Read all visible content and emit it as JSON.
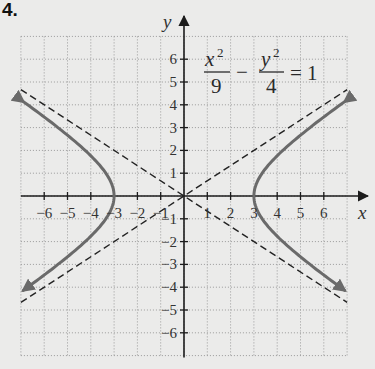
{
  "problem_number": "4.",
  "equation": {
    "term1_num": "x",
    "term1_exp": "2",
    "term1_den": "9",
    "operator": "−",
    "term2_num": "y",
    "term2_exp": "2",
    "term2_den": "4",
    "rhs": "= 1"
  },
  "colors": {
    "background": "#ebebea",
    "axis": "#1c1c1c",
    "grid": "#9a9a9a",
    "curve": "#6a6a6a",
    "asymptote": "#222222",
    "text": "#333333"
  },
  "chart_data": {
    "type": "line",
    "xlabel": "x",
    "ylabel": "y",
    "xlim": [
      -7,
      7
    ],
    "ylim": [
      -7,
      7
    ],
    "grid": true,
    "grid_style": "dotted",
    "legend": null,
    "x_ticks": [
      -6,
      -5,
      -4,
      -3,
      -2,
      -1,
      1,
      2,
      3,
      4,
      5,
      6
    ],
    "x_tick_labels": [
      "−6",
      "−5",
      "−4",
      "−3",
      "−2",
      "−1",
      "1",
      "2",
      "3",
      "4",
      "5",
      "6"
    ],
    "y_ticks": [
      6,
      5,
      4,
      3,
      2,
      1,
      -1,
      -2,
      -3,
      -4,
      -5,
      -6
    ],
    "y_tick_labels": [
      "6",
      "5",
      "4",
      "3",
      "2",
      "1",
      "−1",
      "−2",
      "−3",
      "−4",
      "−5",
      "−6"
    ],
    "series": [
      {
        "name": "hyperbola right branch",
        "style": "solid",
        "equation": "x^2/9 - y^2/4 = 1",
        "x_range": [
          3,
          6.9
        ],
        "vertex": [
          3,
          0
        ],
        "endpoints": [
          [
            6.9,
            4.14
          ],
          [
            6.9,
            -4.14
          ]
        ],
        "arrows": true
      },
      {
        "name": "hyperbola left branch",
        "style": "solid",
        "equation": "x^2/9 - y^2/4 = 1",
        "x_range": [
          -6.9,
          -3
        ],
        "vertex": [
          -3,
          0
        ],
        "endpoints": [
          [
            -6.9,
            4.14
          ],
          [
            -6.9,
            -4.14
          ]
        ],
        "arrows": true
      },
      {
        "name": "asymptote y = (2/3)x",
        "style": "dashed",
        "slope": 0.6667,
        "x_range": [
          -7,
          7
        ]
      },
      {
        "name": "asymptote y = -(2/3)x",
        "style": "dashed",
        "slope": -0.6667,
        "x_range": [
          -7,
          7
        ]
      }
    ],
    "vertices": [
      [
        -3,
        0
      ],
      [
        3,
        0
      ]
    ]
  }
}
